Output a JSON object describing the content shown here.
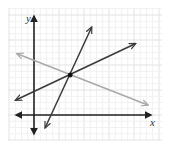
{
  "diagram": {
    "type": "coordinate-plane",
    "axes": {
      "x_label": "x",
      "y_label": "y",
      "x_range": [
        -1.5,
        10
      ],
      "y_range": [
        -2,
        8.5
      ],
      "origin": [
        0,
        0
      ]
    },
    "grid": {
      "on": true,
      "minor_step": 0.5,
      "major_step": 1
    },
    "colors": {
      "grid_minor": "#f1f1f1",
      "grid_major": "#e2e2e2",
      "axis": "#222222",
      "line_dark": "#3a3a3a",
      "line_light": "#a9a9a9",
      "point": "#111111"
    },
    "lines": [
      {
        "name": "steep-line",
        "from": [
          0.9,
          -1.0
        ],
        "to": [
          4.6,
          7.0
        ],
        "color_key": "line_dark",
        "arrows": "both"
      },
      {
        "name": "rising-line",
        "from": [
          -1.45,
          1.2
        ],
        "to": [
          8.1,
          5.7
        ],
        "color_key": "line_dark",
        "arrows": "both"
      },
      {
        "name": "falling-line",
        "from": [
          -1.35,
          4.9
        ],
        "to": [
          9.1,
          0.8
        ],
        "color_key": "line_light",
        "arrows": "both"
      }
    ],
    "intersection_point": [
      2.9,
      3.2
    ]
  }
}
